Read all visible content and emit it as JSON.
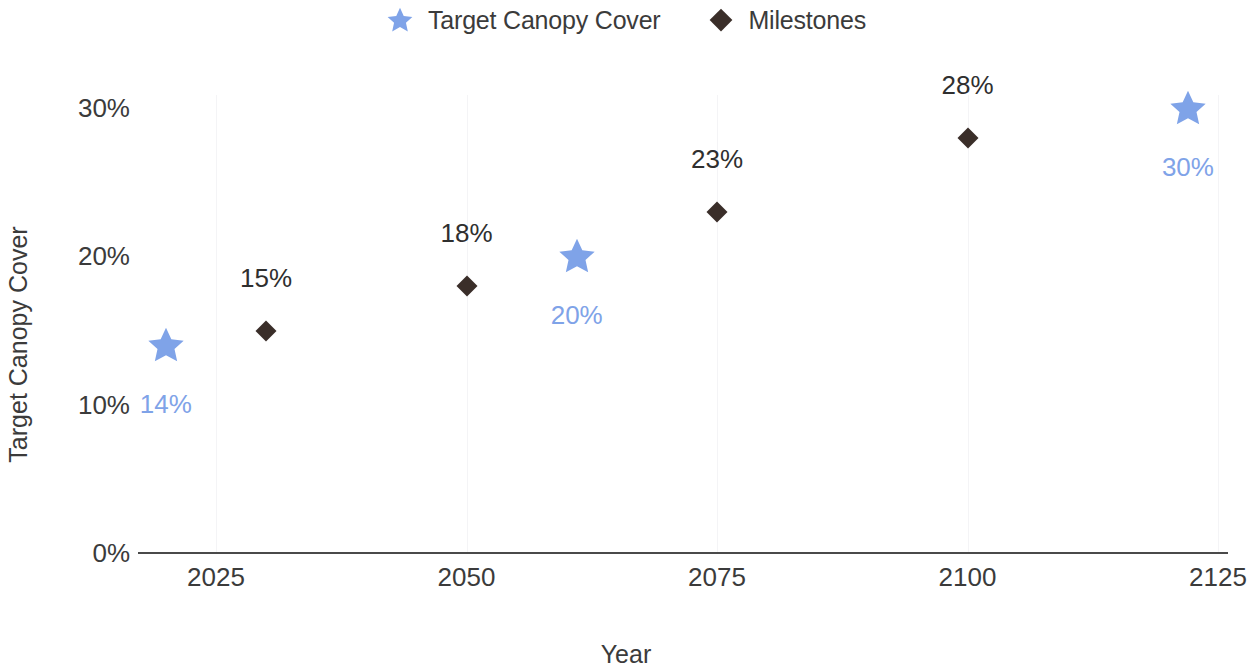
{
  "chart_data": {
    "type": "scatter",
    "title": "",
    "xlabel": "Year",
    "ylabel": "Target Canopy Cover",
    "xlim": [
      2014,
      2130
    ],
    "ylim": [
      0,
      31
    ],
    "x_ticks": [
      "2025",
      "2050",
      "2075",
      "2100",
      "2125"
    ],
    "y_ticks": [
      "0%",
      "10%",
      "20%",
      "30%"
    ],
    "grid": false,
    "legend_position": "top-center",
    "series": [
      {
        "name": "Target Canopy Cover",
        "marker": "star",
        "color": "#7FA3E8",
        "points": [
          {
            "x": 2020,
            "y": 14,
            "label": "14%"
          },
          {
            "x": 2061,
            "y": 20,
            "label": "20%"
          },
          {
            "x": 2122,
            "y": 30,
            "label": "30%"
          }
        ]
      },
      {
        "name": "Milestones",
        "marker": "diamond",
        "color": "#3A2E29",
        "points": [
          {
            "x": 2030,
            "y": 15,
            "label": "15%"
          },
          {
            "x": 2050,
            "y": 18,
            "label": "18%"
          },
          {
            "x": 2075,
            "y": 23,
            "label": "23%"
          },
          {
            "x": 2100,
            "y": 28,
            "label": "28%"
          }
        ]
      }
    ]
  },
  "legend": {
    "items": [
      {
        "label": "Target Canopy Cover",
        "marker": "star",
        "color": "#7FA3E8"
      },
      {
        "label": "Milestones",
        "marker": "diamond",
        "color": "#3A2E29"
      }
    ]
  },
  "axes": {
    "x_title": "Year",
    "y_title": "Target Canopy Cover",
    "x_tick_labels": [
      "2025",
      "2050",
      "2075",
      "2100",
      "2125"
    ],
    "y_tick_labels": [
      "30%",
      "20%",
      "10%",
      "0%"
    ]
  },
  "colors": {
    "target": "#7FA3E8",
    "milestone": "#3A2E29",
    "axis": "#4a4a4a",
    "text": "#3b3b3b",
    "background": "#ffffff"
  }
}
